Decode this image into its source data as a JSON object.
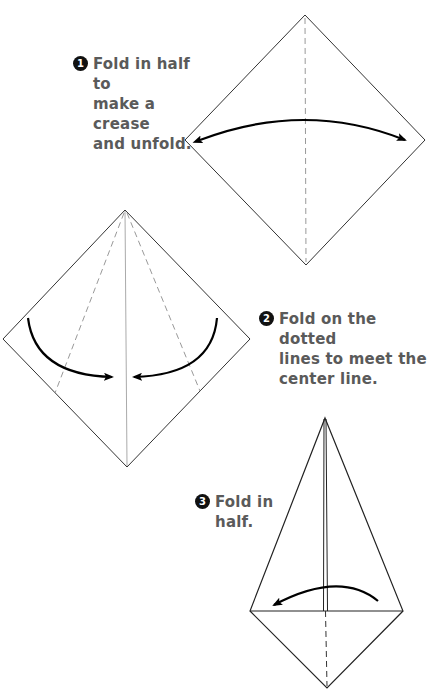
{
  "steps": [
    {
      "number": "1",
      "lines": [
        "Fold in half to",
        "make a crease",
        "and unfold."
      ]
    },
    {
      "number": "2",
      "lines": [
        "Fold on the dotted",
        "lines to meet the",
        "center line."
      ]
    },
    {
      "number": "3",
      "lines": [
        "Fold in",
        "half."
      ]
    }
  ],
  "colors": {
    "text": "#5a5a5a",
    "badge": "#111111",
    "outline": "#222222",
    "crease": "#999999",
    "arrow": "#000000"
  },
  "diagrams": [
    {
      "name": "square-diamond",
      "step": "1",
      "arrow": "double-headed arc, left-right"
    },
    {
      "name": "diamond-with-fold-lines",
      "step": "2",
      "arrow": "two curved arrows toward center"
    },
    {
      "name": "kite-shape",
      "step": "3",
      "arrow": "arc arrow pointing left"
    }
  ]
}
